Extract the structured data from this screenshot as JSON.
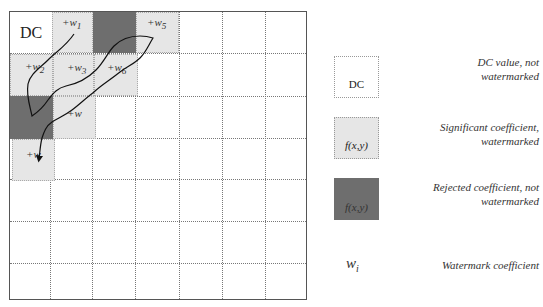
{
  "diagram": {
    "grid": {
      "rows": 7,
      "cols": 7
    },
    "cells": {
      "dc": {
        "label": "DC",
        "type": "dc"
      },
      "w1": {
        "label": "+w1",
        "base": "+w",
        "sub": "1",
        "type": "significant"
      },
      "w2": {
        "label": "+w2",
        "base": "+w",
        "sub": "2",
        "type": "significant"
      },
      "w3": {
        "label": "+w3",
        "base": "+w",
        "sub": "3",
        "type": "significant"
      },
      "w4": {
        "label": "+w",
        "base": "+w",
        "sub": "",
        "type": "significant"
      },
      "w5": {
        "label": "+w5",
        "base": "+w",
        "sub": "5",
        "type": "significant"
      },
      "w6": {
        "label": "+w6",
        "base": "+w",
        "sub": "6",
        "type": "significant"
      },
      "w8": {
        "label": "+w",
        "base": "+w",
        "sub": "",
        "type": "significant"
      },
      "rejected_1": {
        "type": "rejected"
      },
      "rejected_2": {
        "type": "rejected"
      }
    },
    "scan_path": "zigzag arrow through watermarked coefficients ending in arrowhead"
  },
  "legend": {
    "items": [
      {
        "box_label": "DC",
        "text_line1": "DC value, not",
        "text_line2": "watermarked",
        "style": "white"
      },
      {
        "box_label": "f(x,y)",
        "text_line1": "Significant coefficient,",
        "text_line2": "watermarked",
        "style": "light"
      },
      {
        "box_label": "f(x,y)",
        "text_line1": "Rejected coefficient, not",
        "text_line2": "watermarked",
        "style": "dark"
      },
      {
        "symbol": "w",
        "symbol_sub": "i",
        "text_line1": "Watermark coefficient"
      }
    ]
  },
  "colors": {
    "light_cell": "#e6e6e6",
    "dark_cell": "#6e6e6e",
    "grid_line": "#777777",
    "path": "#111111"
  }
}
